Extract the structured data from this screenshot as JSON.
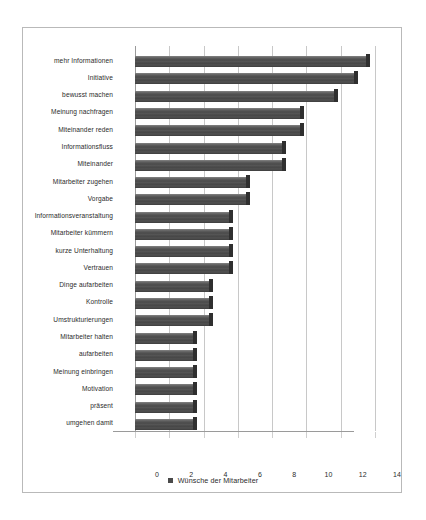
{
  "chart_data": {
    "type": "bar",
    "orientation": "horizontal",
    "title": "",
    "xlabel": "",
    "ylabel": "",
    "xlim": [
      0,
      14
    ],
    "xticks": [
      0,
      2,
      4,
      6,
      8,
      10,
      12,
      14
    ],
    "grid": true,
    "legend_position": "bottom",
    "legend": [
      "Wünsche der Mitarbeiter"
    ],
    "series": [
      {
        "name": "Wünsche der Mitarbeiter",
        "color": "#4a4a4a",
        "values": [
          13.5,
          12.8,
          11.6,
          9.6,
          9.6,
          8.6,
          8.6,
          6.5,
          6.5,
          5.5,
          5.5,
          5.5,
          5.5,
          4.3,
          4.3,
          4.3,
          3.4,
          3.4,
          3.4,
          3.4,
          3.4,
          3.4
        ]
      }
    ],
    "categories": [
      "mehr Informationen",
      "Initiative",
      "bewusst machen",
      "Meinung nachfragen",
      "Miteinander reden",
      "Informationsfluss",
      "Miteinander",
      "Mitarbeiter zugehen",
      "Vorgabe",
      "Informationsveranstaltung",
      "Mitarbeiter kümmern",
      "kurze Unterhaltung",
      "Vertrauen",
      "Dinge aufarbeiten",
      "Kontrolle",
      "Umstrukturierungen",
      "Mitarbeiter halten",
      "aufarbeiten",
      "Meinung einbringen",
      "Motivation",
      "präsent",
      "umgehen damit"
    ]
  }
}
